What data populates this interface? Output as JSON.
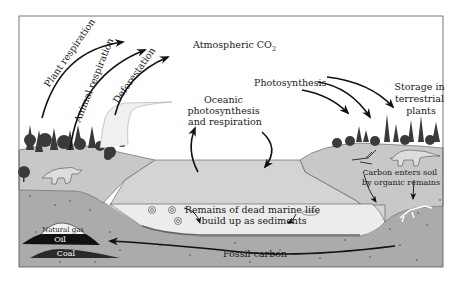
{
  "diagram": {
    "labels": {
      "atmospheric_co2": "Atmospheric CO",
      "atmospheric_co2_sub": "2",
      "plant_respiration": "Plant respiration",
      "animal_respiration": "Animal respiration",
      "deforestation": "Deforestation",
      "photosynthesis": "Photosynthesis",
      "storage_line1": "Storage in",
      "storage_line2": "terrestrial",
      "storage_line3": "plants",
      "oceanic_line1": "Oceanic",
      "oceanic_line2": "photosynthesis",
      "oceanic_line3": "and respiration",
      "carbon_soil_line1": "Carbon enters soil",
      "carbon_soil_line2": "by organic remains",
      "marine_line1": "Remains of dead marine life",
      "marine_line2": "build up as sediments",
      "fossil_carbon": "Fossil carbon",
      "natural_gas": "Natural gas",
      "oil": "Oil",
      "coal": "Coal"
    },
    "colors": {
      "sky": "#ffffff",
      "land": "#c8c8c8",
      "water": "#d4d4d4",
      "sediment_layer": "#ececec",
      "subsoil": "#ababab",
      "frame": "#555555",
      "oil": "#111111",
      "coal": "#2a2a2a",
      "gas": "#f2f2f2",
      "arrow": "#111111",
      "tree": "#3a3a3a"
    }
  }
}
